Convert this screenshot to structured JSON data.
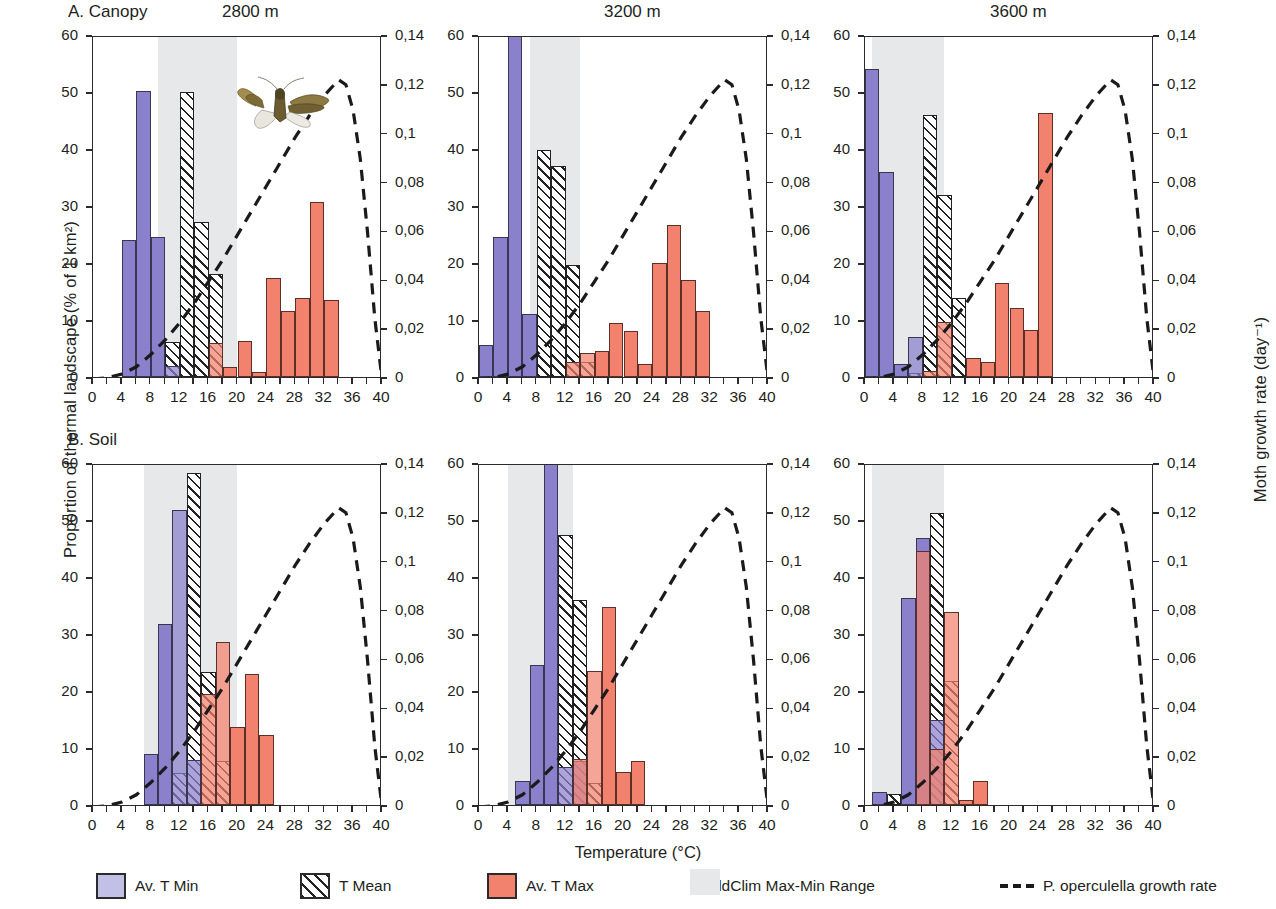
{
  "figure": {
    "xlabel": "Temperature (°C)",
    "ylabel_left": "Proportion of thermal  landscape (% of 1 km²)",
    "ylabel_right": "Moth growth rate (day⁻¹)",
    "panel_a_label": "A. Canopy",
    "panel_b_label": "B. Soil",
    "column_titles": [
      "2800 m",
      "3200 m",
      "3600 m"
    ],
    "colors": {
      "t_min": "#8a80cc",
      "t_min_legend": "#c3c0e8",
      "t_max": "#f2816e",
      "t_mean_hatch": "#222222",
      "worldclim_band": "#e6e8e9",
      "growth_curve": "#1a1a1a",
      "axis": "#2b2b2b"
    }
  },
  "legend": {
    "items": [
      {
        "label": "Av. T Min",
        "icon": "filled-square-purple"
      },
      {
        "label": "T Mean",
        "icon": "hatched-square"
      },
      {
        "label": "Av. T Max",
        "icon": "filled-square-salmon"
      },
      {
        "label": "WorldClim Max-Min Range",
        "icon": "gray-band-square"
      },
      {
        "label": "P. operculella growth rate",
        "icon": "dashed-line"
      }
    ]
  },
  "axes": {
    "x_ticks": [
      0,
      4,
      8,
      12,
      16,
      20,
      24,
      28,
      32,
      36,
      40
    ],
    "x_minor_step": 2,
    "xlim": [
      0,
      40
    ],
    "y_left_ticks": [
      0,
      10,
      20,
      30,
      40,
      50,
      60
    ],
    "ylim_left": [
      0,
      60
    ],
    "y_right_ticks": [
      "0",
      "0,02",
      "0,04",
      "0,06",
      "0,08",
      "0,1",
      "0,12",
      "0,14"
    ],
    "y_right_values": [
      0,
      0.02,
      0.04,
      0.06,
      0.08,
      0.1,
      0.12,
      0.14
    ],
    "ylim_right": [
      0,
      0.14
    ],
    "grid": false
  },
  "chart_data": {
    "type": "bar",
    "xlabel": "Temperature (°C)",
    "ylabel": "Proportion of thermal  landscape (% of 1 km²)",
    "ylabel_secondary": "Moth growth rate (day⁻¹)",
    "xlim": [
      0,
      40
    ],
    "ylim": [
      0,
      60
    ],
    "ylim_secondary": [
      0,
      0.14
    ],
    "bin_width": 2,
    "legend_position": "bottom",
    "growth_curve": {
      "name": "P. operculella growth rate",
      "style": "dashed",
      "axis": "secondary",
      "x": [
        0,
        2,
        4,
        6,
        8,
        10,
        12,
        14,
        16,
        18,
        20,
        22,
        24,
        26,
        28,
        30,
        32,
        34,
        35,
        36,
        37,
        38,
        39,
        40
      ],
      "y": [
        0.0,
        0.0005,
        0.002,
        0.005,
        0.01,
        0.016,
        0.023,
        0.031,
        0.04,
        0.049,
        0.059,
        0.069,
        0.079,
        0.089,
        0.099,
        0.108,
        0.116,
        0.1225,
        0.1205,
        0.11,
        0.09,
        0.06,
        0.025,
        0.0
      ]
    },
    "panels": [
      {
        "id": "A1",
        "row": "A. Canopy",
        "column": "2800 m",
        "worldclim_range": [
          9,
          20
        ],
        "series": [
          {
            "name": "Av. T Min",
            "bins": [
              [
                4,
                6,
                24.0
              ],
              [
                6,
                8,
                50.2
              ],
              [
                8,
                10,
                24.6
              ],
              [
                10,
                12,
                2.0
              ]
            ]
          },
          {
            "name": "T Mean",
            "bins": [
              [
                10,
                12,
                6.2
              ],
              [
                12,
                14,
                50.0
              ],
              [
                14,
                16,
                27.2
              ],
              [
                16,
                18,
                18.0
              ]
            ]
          },
          {
            "name": "Av. T Max",
            "bins": [
              [
                16,
                18,
                6.0
              ],
              [
                18,
                20,
                1.7
              ],
              [
                20,
                22,
                6.3
              ],
              [
                22,
                24,
                0.8
              ],
              [
                24,
                26,
                17.4
              ],
              [
                26,
                28,
                11.5
              ],
              [
                28,
                30,
                13.9
              ],
              [
                30,
                32,
                30.7
              ],
              [
                32,
                34,
                13.5
              ]
            ]
          }
        ]
      },
      {
        "id": "A2",
        "row": "A. Canopy",
        "column": "3200 m",
        "worldclim_range": [
          7,
          14
        ],
        "series": [
          {
            "name": "Av. T Min",
            "bins": [
              [
                0,
                2,
                5.6
              ],
              [
                2,
                4,
                24.6
              ],
              [
                4,
                6,
                60.0
              ],
              [
                6,
                8,
                11.0
              ]
            ]
          },
          {
            "name": "T Mean",
            "bins": [
              [
                8,
                10,
                39.8
              ],
              [
                10,
                12,
                37.0
              ],
              [
                12,
                14,
                19.6
              ],
              [
                14,
                16,
                2.6
              ]
            ]
          },
          {
            "name": "Av. T Max",
            "bins": [
              [
                12,
                14,
                2.6
              ],
              [
                14,
                16,
                4.3
              ],
              [
                16,
                18,
                4.6
              ],
              [
                18,
                20,
                9.5
              ],
              [
                20,
                22,
                8.0
              ],
              [
                22,
                24,
                2.3
              ],
              [
                24,
                26,
                20.0
              ],
              [
                26,
                28,
                26.6
              ],
              [
                28,
                30,
                17.0
              ],
              [
                30,
                32,
                11.5
              ]
            ]
          }
        ]
      },
      {
        "id": "A3",
        "row": "A. Canopy",
        "column": "3600 m",
        "worldclim_range": [
          1,
          11
        ],
        "series": [
          {
            "name": "Av. T Min",
            "bins": [
              [
                0,
                2,
                54.0
              ],
              [
                2,
                4,
                36.0
              ],
              [
                4,
                6,
                2.2
              ],
              [
                6,
                8,
                7.0
              ]
            ]
          },
          {
            "name": "T Mean",
            "bins": [
              [
                6,
                8,
                0.7
              ],
              [
                8,
                10,
                46.0
              ],
              [
                10,
                12,
                32.0
              ],
              [
                12,
                14,
                13.8
              ]
            ]
          },
          {
            "name": "Av. T Max",
            "bins": [
              [
                8,
                10,
                1.0
              ],
              [
                10,
                12,
                9.7
              ],
              [
                14,
                16,
                3.3
              ],
              [
                16,
                18,
                2.6
              ],
              [
                18,
                20,
                16.5
              ],
              [
                20,
                22,
                12.1
              ],
              [
                22,
                24,
                8.2
              ],
              [
                24,
                26,
                46.4
              ]
            ]
          }
        ]
      },
      {
        "id": "B1",
        "row": "B. Soil",
        "column": "2800 m",
        "worldclim_range": [
          7,
          20
        ],
        "series": [
          {
            "name": "Av. T Min",
            "bins": [
              [
                7,
                9,
                9.0
              ],
              [
                9,
                11,
                31.7
              ],
              [
                11,
                13,
                51.8
              ],
              [
                13,
                15,
                7.9
              ]
            ]
          },
          {
            "name": "T Mean",
            "bins": [
              [
                11,
                13,
                5.6
              ],
              [
                13,
                15,
                58.3
              ],
              [
                15,
                17,
                23.3
              ],
              [
                17,
                19,
                7.8
              ]
            ]
          },
          {
            "name": "Av. T Max",
            "bins": [
              [
                15,
                17,
                19.5
              ],
              [
                17,
                19,
                28.6
              ],
              [
                19,
                21,
                13.6
              ],
              [
                21,
                23,
                23.0
              ],
              [
                23,
                25,
                12.3
              ]
            ]
          }
        ]
      },
      {
        "id": "B2",
        "row": "B. Soil",
        "column": "3200 m",
        "worldclim_range": [
          4,
          13
        ],
        "series": [
          {
            "name": "Av. T Min",
            "bins": [
              [
                5,
                7,
                4.3
              ],
              [
                7,
                9,
                24.5
              ],
              [
                9,
                11,
                60.0
              ],
              [
                11,
                13,
                6.7
              ],
              [
                13,
                15,
                7.7
              ]
            ]
          },
          {
            "name": "T Mean",
            "bins": [
              [
                11,
                13,
                47.3
              ],
              [
                13,
                15,
                36.0
              ],
              [
                15,
                17,
                3.9
              ]
            ]
          },
          {
            "name": "Av. T Max",
            "bins": [
              [
                13,
                15,
                8.0
              ],
              [
                15,
                17,
                23.5
              ],
              [
                17,
                19,
                34.8
              ],
              [
                19,
                21,
                5.8
              ],
              [
                21,
                23,
                7.7
              ]
            ]
          }
        ]
      },
      {
        "id": "B3",
        "row": "B. Soil",
        "column": "3600 m",
        "worldclim_range": [
          1,
          11
        ],
        "series": [
          {
            "name": "Av. T Min",
            "bins": [
              [
                1,
                3,
                2.2
              ],
              [
                5,
                7,
                36.4
              ],
              [
                7,
                9,
                46.8
              ],
              [
                9,
                11,
                15.0
              ]
            ]
          },
          {
            "name": "T Mean",
            "bins": [
              [
                3,
                5,
                1.9
              ],
              [
                9,
                11,
                51.3
              ],
              [
                11,
                13,
                21.8
              ]
            ]
          },
          {
            "name": "Av. T Max",
            "bins": [
              [
                7,
                9,
                44.5
              ],
              [
                9,
                11,
                9.9
              ],
              [
                11,
                13,
                33.8
              ],
              [
                13,
                15,
                0.9
              ],
              [
                15,
                17,
                4.2
              ]
            ]
          }
        ]
      }
    ]
  },
  "annotations": {
    "moth_photo": "moth-photo"
  }
}
